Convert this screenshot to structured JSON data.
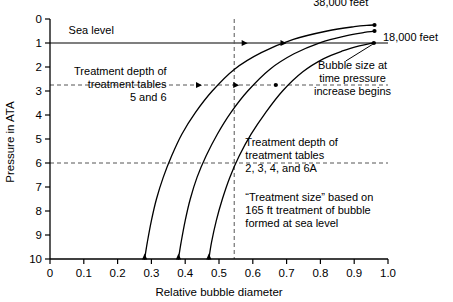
{
  "chart_data": {
    "type": "line",
    "title": "",
    "xlabel": "Relative bubble diameter",
    "ylabel": "Pressure in ATA",
    "xlim": [
      0,
      1.0
    ],
    "ylim": [
      0,
      10
    ],
    "y_axis_inverted": true,
    "grid": false,
    "legend_position": "inline-annotations",
    "xticks": [
      "0",
      "0.1",
      "0.2",
      "0.3",
      "0.4",
      "0.5",
      "0.6",
      "0.7",
      "0.8",
      "0.9",
      "1.0"
    ],
    "xtick_values": [
      0,
      0.1,
      0.2,
      0.3,
      0.4,
      0.5,
      0.6,
      0.7,
      0.8,
      0.9,
      1.0
    ],
    "yticks": [
      "0",
      "1",
      "2",
      "3",
      "4",
      "5",
      "6",
      "7",
      "8",
      "9",
      "10"
    ],
    "ytick_values": [
      0,
      1,
      2,
      3,
      4,
      5,
      6,
      7,
      8,
      9,
      10
    ],
    "series": [
      {
        "name": "38,000 feet",
        "label": "38,000 feet",
        "x": [
          0.28,
          0.288,
          0.3,
          0.315,
          0.335,
          0.36,
          0.39,
          0.43,
          0.48,
          0.545,
          0.625,
          0.72,
          0.82,
          0.9,
          0.945,
          0.96
        ],
        "y": [
          10.0,
          9.3,
          8.4,
          7.5,
          6.6,
          5.7,
          4.8,
          3.9,
          3.0,
          2.1,
          1.4,
          0.85,
          0.5,
          0.32,
          0.26,
          0.25
        ],
        "markers": [
          {
            "x": 0.28,
            "y": 10.0,
            "shape": "triangle-up"
          },
          {
            "x": 0.435,
            "y": 2.75,
            "shape": "triangle-right"
          },
          {
            "x": 0.57,
            "y": 1.0,
            "shape": "triangle-right"
          },
          {
            "x": 0.96,
            "y": 0.25,
            "shape": "dot"
          }
        ]
      },
      {
        "name": "18,000 feet",
        "label": "18,000 feet",
        "x": [
          0.38,
          0.388,
          0.4,
          0.415,
          0.435,
          0.462,
          0.495,
          0.535,
          0.585,
          0.65,
          0.722,
          0.8,
          0.875,
          0.93,
          0.955,
          0.96
        ],
        "y": [
          10.0,
          9.3,
          8.4,
          7.5,
          6.6,
          5.7,
          4.8,
          3.9,
          3.0,
          2.1,
          1.45,
          0.98,
          0.7,
          0.56,
          0.52,
          0.5
        ],
        "markers": [
          {
            "x": 0.38,
            "y": 10.0,
            "shape": "triangle-up"
          },
          {
            "x": 0.545,
            "y": 2.75,
            "shape": "triangle-right"
          },
          {
            "x": 0.685,
            "y": 1.0,
            "shape": "triangle-right"
          },
          {
            "x": 0.96,
            "y": 0.5,
            "shape": "dot"
          }
        ]
      },
      {
        "name": "sea level",
        "label": "",
        "x": [
          0.47,
          0.478,
          0.492,
          0.51,
          0.532,
          0.56,
          0.595,
          0.638,
          0.688,
          0.748,
          0.81,
          0.868,
          0.915,
          0.945,
          0.958,
          0.962
        ],
        "y": [
          10.0,
          9.3,
          8.4,
          7.5,
          6.6,
          5.7,
          4.8,
          3.9,
          3.0,
          2.2,
          1.65,
          1.32,
          1.12,
          1.03,
          1.0,
          1.0
        ],
        "markers": [
          {
            "x": 0.47,
            "y": 10.0,
            "shape": "triangle-up"
          },
          {
            "x": 0.668,
            "y": 2.75,
            "shape": "dot"
          },
          {
            "x": 0.958,
            "y": 1.0,
            "shape": "dot"
          }
        ]
      }
    ],
    "reference_lines": [
      {
        "name": "sea-level-line",
        "orientation": "horizontal",
        "value": 1.0,
        "style": "solid",
        "label": "Sea level"
      },
      {
        "name": "treatment-depth-5-6",
        "orientation": "horizontal",
        "value": 2.75,
        "style": "dashed"
      },
      {
        "name": "treatment-depth-2-3-4-6a",
        "orientation": "horizontal",
        "value": 6.0,
        "style": "dashed"
      },
      {
        "name": "treatment-size-line",
        "orientation": "vertical",
        "value": 0.545,
        "style": "dashed"
      }
    ],
    "annotations": [
      {
        "name": "sea-level-label",
        "text": "Sea level",
        "x": 0.055,
        "y": 0.62,
        "align": "start"
      },
      {
        "name": "label-38000",
        "text": "38,000 feet",
        "x": 0.86,
        "y": -0.55,
        "align": "middle"
      },
      {
        "name": "label-18000",
        "text": "18,000 feet",
        "x": 0.985,
        "y": 0.9,
        "align": "start"
      },
      {
        "name": "bubble-size-note",
        "lines": [
          "Bubble size at",
          "time pressure",
          "increase begins"
        ],
        "x": 0.895,
        "y": 2.1,
        "align": "middle"
      },
      {
        "name": "treatment-5-6-note",
        "lines": [
          "Treatment depth of",
          "treatment tables",
          "5 and 6"
        ],
        "x": 0.345,
        "y": 2.35,
        "align": "end"
      },
      {
        "name": "treatment-2-3-4-6a-note",
        "lines": [
          "Treatment depth of",
          "treatment tables",
          "2, 3, 4, and 6A"
        ],
        "x": 0.578,
        "y": 5.3,
        "align": "start"
      },
      {
        "name": "treatment-size-note",
        "lines": [
          "“Treatment size” based on",
          "165 ft treatment of bubble",
          "formed at sea level"
        ],
        "x": 0.578,
        "y": 7.6,
        "align": "start"
      }
    ]
  },
  "axes": {
    "x_title": "Relative bubble diameter",
    "y_title": "Pressure in ATA",
    "xticks": [
      "0",
      "0.1",
      "0.2",
      "0.3",
      "0.4",
      "0.5",
      "0.6",
      "0.7",
      "0.8",
      "0.9",
      "1.0"
    ],
    "yticks": [
      "0",
      "1",
      "2",
      "3",
      "4",
      "5",
      "6",
      "7",
      "8",
      "9",
      "10"
    ]
  },
  "labels": {
    "sea_level": "Sea level",
    "feet_38000": "38,000 feet",
    "feet_18000": "18,000 feet",
    "bubble_note_1": "Bubble size at",
    "bubble_note_2": "time pressure",
    "bubble_note_3": "increase begins",
    "t56_1": "Treatment depth of",
    "t56_2": "treatment tables",
    "t56_3": "5 and 6",
    "t2346a_1": "Treatment depth of",
    "t2346a_2": "treatment tables",
    "t2346a_3": "2, 3, 4, and 6A",
    "tsize_1": "“Treatment size” based on",
    "tsize_2": "165 ft treatment of bubble",
    "tsize_3": "formed at sea level"
  },
  "colors": {
    "line": "#000000",
    "axis": "#000000",
    "dashed": "#555555",
    "background": "#ffffff"
  }
}
